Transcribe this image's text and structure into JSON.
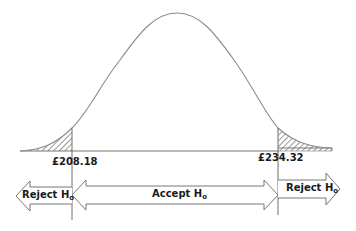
{
  "diagram": {
    "type": "normal-distribution-hypothesis-test",
    "critical_values": {
      "lower": "£208.18",
      "upper": "£234.32"
    },
    "regions": {
      "left": {
        "label": "Reject H",
        "subscript": "o"
      },
      "middle": {
        "label": "Accept H",
        "subscript": "o"
      },
      "right": {
        "label": "Reject H",
        "subscript": "o"
      }
    },
    "colors": {
      "curve": "#8c8c8c",
      "lines": "#6e6e6e",
      "hatch": "#555555",
      "text": "#1a1a1a",
      "background": "#ffffff"
    }
  }
}
